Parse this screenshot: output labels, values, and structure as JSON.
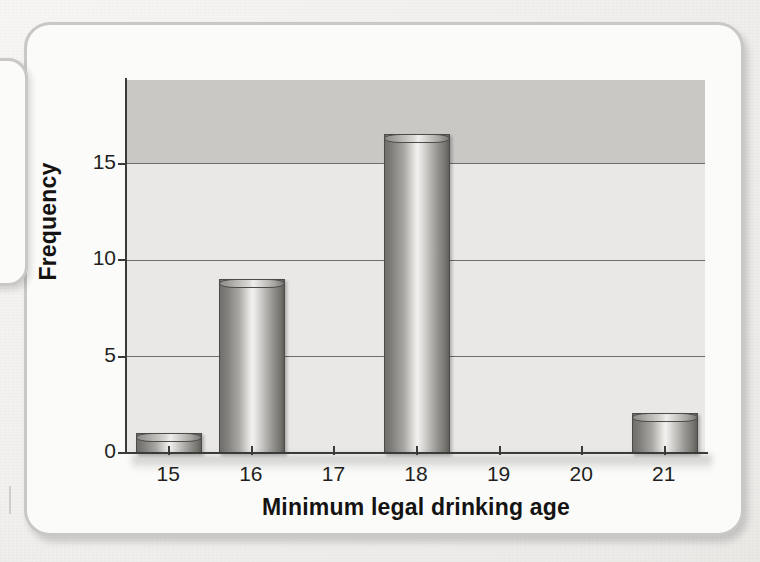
{
  "figure": {
    "y_axis_title": "Frequency",
    "x_axis_title": "Minimum legal drinking age"
  },
  "chart_data": {
    "type": "bar",
    "title": "",
    "xlabel": "Minimum legal drinking age",
    "ylabel": "Frequency",
    "categories": [
      "15",
      "16",
      "17",
      "18",
      "19",
      "20",
      "21"
    ],
    "values": [
      1,
      9,
      0,
      16.5,
      0,
      0,
      2
    ],
    "ylim": [
      0,
      19.3
    ],
    "xlim": [
      14.5,
      21.5
    ],
    "y_ticks": [
      "0",
      "5",
      "10",
      "15"
    ],
    "y_tick_values": [
      0,
      5,
      10,
      15
    ],
    "x_ticks": [
      "15",
      "16",
      "17",
      "18",
      "19",
      "20",
      "21"
    ],
    "grid": "horizontal",
    "legend": "none",
    "bar_style": "3d-cylinder",
    "colors": {
      "bar_light": "#f2f1ef",
      "bar_dark": "#5f5e5a",
      "plot_background": "#e9e8e6",
      "plot_upper_band": "#c9c8c5",
      "axis": "#3a3a38",
      "gridline": "#6d6c69",
      "text": "#231f1e",
      "page": "#f4f3f1",
      "frame_border": "#c9c8c6"
    }
  }
}
